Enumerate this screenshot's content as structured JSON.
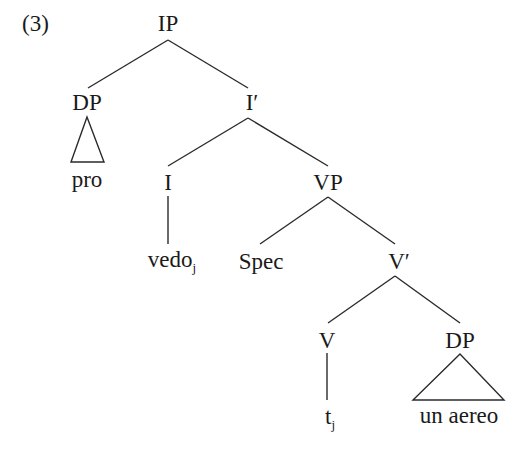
{
  "example_number": "(3)",
  "tree": {
    "nodes": {
      "IP": {
        "label": "IP",
        "x": 168,
        "y": 12
      },
      "DP1": {
        "label": "DP",
        "x": 87,
        "y": 91
      },
      "I_bar": {
        "label": "I′",
        "x": 250,
        "y": 91
      },
      "pro": {
        "label": "pro",
        "x": 87,
        "y": 171
      },
      "I": {
        "label": "I",
        "x": 168,
        "y": 171
      },
      "VP": {
        "label": "VP",
        "x": 328,
        "y": 171
      },
      "vedo": {
        "label": "vedo",
        "subscript": "j",
        "x": 168,
        "y": 251
      },
      "Spec": {
        "label": "Spec",
        "x": 260,
        "y": 251
      },
      "V_bar": {
        "label": "V′",
        "x": 397,
        "y": 251
      },
      "V": {
        "label": "V",
        "x": 327,
        "y": 330
      },
      "DP2": {
        "label": "DP",
        "x": 460,
        "y": 330
      },
      "t": {
        "label": "t",
        "subscript": "j",
        "x": 327,
        "y": 407
      },
      "un_aereo": {
        "label": "un aereo",
        "x": 460,
        "y": 405
      }
    },
    "edges": [
      [
        "IP",
        "DP1"
      ],
      [
        "IP",
        "I_bar"
      ],
      [
        "I_bar",
        "I"
      ],
      [
        "I_bar",
        "VP"
      ],
      [
        "I",
        "vedo"
      ],
      [
        "VP",
        "Spec"
      ],
      [
        "VP",
        "V_bar"
      ],
      [
        "V_bar",
        "V"
      ],
      [
        "V_bar",
        "DP2"
      ],
      [
        "V",
        "t"
      ]
    ],
    "triangles": [
      {
        "parent": "DP1",
        "child": "pro"
      },
      {
        "parent": "DP2",
        "child": "un_aereo"
      }
    ]
  }
}
